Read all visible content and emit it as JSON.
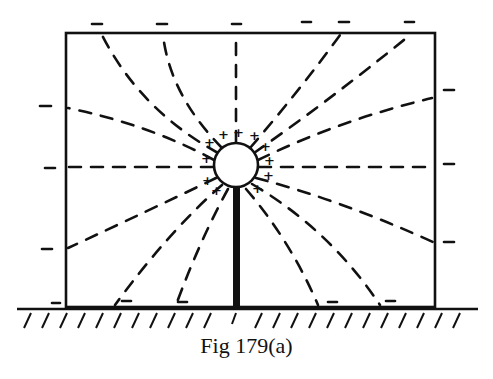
{
  "figure": {
    "caption": "Fig 179(a)",
    "sphere_charge_symbol": "+",
    "wall_charge_symbol": "−",
    "elements": {
      "enclosure": "rectangle",
      "sphere": "circle",
      "rod": "thick vertical rod",
      "ground": "hatched ground line",
      "field_lines": "dashed curves"
    },
    "colors": {
      "ink": "#111111",
      "paper": "#ffffff"
    }
  }
}
